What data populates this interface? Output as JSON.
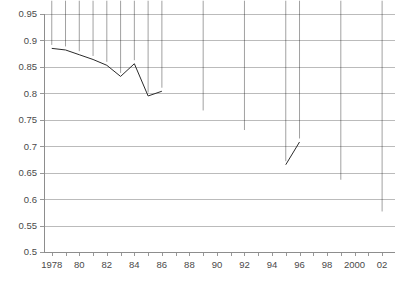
{
  "chart_data": {
    "type": "line",
    "title": "",
    "subtitle": "",
    "xlabel": "",
    "ylabel": "",
    "xlim": [
      1977.4,
      2002.9
    ],
    "ylim": [
      0.5,
      0.95
    ],
    "grid": true,
    "legend": "none",
    "y_ticks": [
      0.5,
      0.55,
      0.6,
      0.65,
      0.7,
      0.75,
      0.8,
      0.85,
      0.9,
      0.95
    ],
    "y_tick_labels": [
      "0.5",
      "0.55",
      "0.6",
      "0.65",
      "0.7",
      "0.75",
      "0.8",
      "0.85",
      "0.9",
      "0.95"
    ],
    "x_ticks": [
      1978,
      1979,
      1980,
      1981,
      1982,
      1983,
      1984,
      1985,
      1986,
      1987,
      1988,
      1989,
      1990,
      1991,
      1992,
      1993,
      1994,
      1995,
      1996,
      1997,
      1998,
      1999,
      2000,
      2001,
      2002
    ],
    "x_labeled_ticks": [
      1978,
      1980,
      1982,
      1984,
      1986,
      1988,
      1990,
      1992,
      1994,
      1996,
      1998,
      2000,
      2002
    ],
    "x_tick_labels": [
      "1978",
      "80",
      "82",
      "84",
      "86",
      "88",
      "90",
      "92",
      "94",
      "96",
      "98",
      "2000",
      "02"
    ],
    "marker_style": "filled-diamond",
    "marker_color": "#222222",
    "line_color": "#2b2b2b",
    "gridline_color": "#b4b4b4",
    "segments": [
      {
        "name": "1978-1986 connected run",
        "connected": true,
        "x": [
          1978,
          1979,
          1980,
          1981,
          1982,
          1983,
          1984,
          1985,
          1986
        ],
        "values": [
          0.885,
          0.882,
          0.873,
          0.864,
          0.853,
          0.832,
          0.856,
          0.795,
          0.804
        ]
      },
      {
        "name": "1989 isolated point",
        "connected": false,
        "x": [
          1989
        ],
        "values": [
          0.761
        ]
      },
      {
        "name": "1992 isolated point",
        "connected": false,
        "x": [
          1992
        ],
        "values": [
          0.724
        ]
      },
      {
        "name": "1995-1996 connected pair",
        "connected": true,
        "x": [
          1995,
          1996
        ],
        "values": [
          0.665,
          0.708
        ]
      },
      {
        "name": "1999 isolated point",
        "connected": false,
        "x": [
          1999
        ],
        "values": [
          0.63
        ]
      },
      {
        "name": "2002 isolated point",
        "connected": false,
        "x": [
          2002
        ],
        "values": [
          0.57
        ]
      }
    ],
    "all_points": [
      {
        "x": 1978,
        "y": 0.885
      },
      {
        "x": 1979,
        "y": 0.882
      },
      {
        "x": 1980,
        "y": 0.873
      },
      {
        "x": 1981,
        "y": 0.864
      },
      {
        "x": 1982,
        "y": 0.853
      },
      {
        "x": 1983,
        "y": 0.832
      },
      {
        "x": 1984,
        "y": 0.856
      },
      {
        "x": 1985,
        "y": 0.795
      },
      {
        "x": 1986,
        "y": 0.804
      },
      {
        "x": 1989,
        "y": 0.761
      },
      {
        "x": 1992,
        "y": 0.724
      },
      {
        "x": 1995,
        "y": 0.665
      },
      {
        "x": 1996,
        "y": 0.708
      },
      {
        "x": 1999,
        "y": 0.63
      },
      {
        "x": 2002,
        "y": 0.57
      }
    ]
  },
  "caption": {
    "cropped_footer_text": ""
  }
}
